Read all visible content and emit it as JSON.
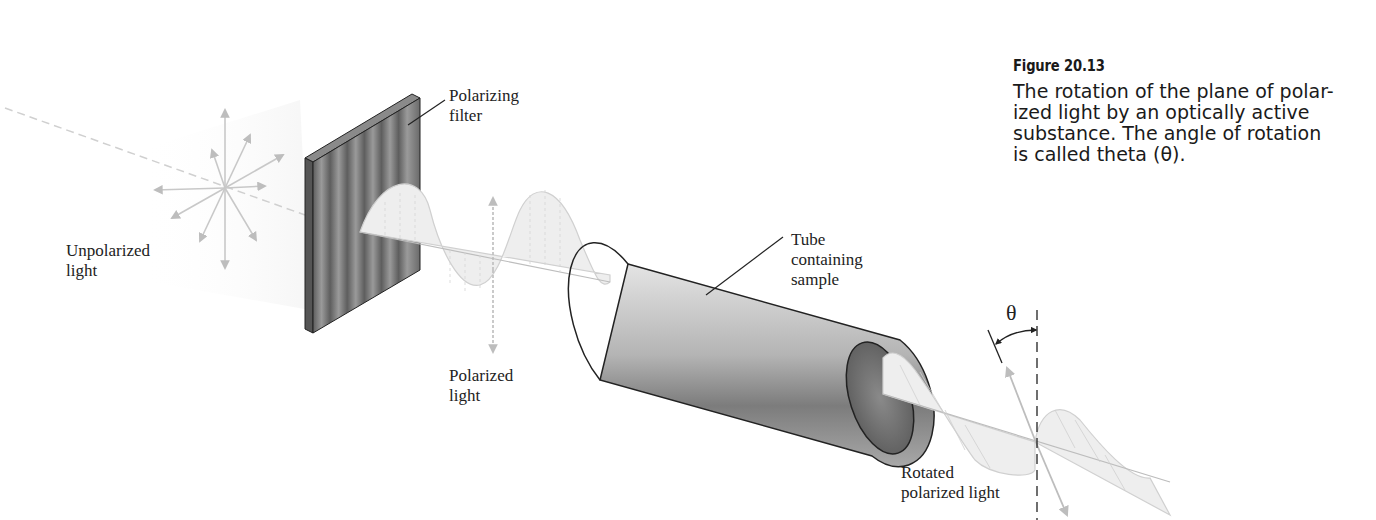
{
  "caption": {
    "figure_number": "Figure 20.13",
    "text": "The rotation of the plane of polar-\nized light by an optically active\nsubstance. The angle of rotation\nis called theta (θ)."
  },
  "labels": {
    "unpolarized_light": "Unpolarized\nlight",
    "polarizing_filter": "Polarizing\nfilter",
    "polarized_light": "Polarized\nlight",
    "tube": "Tube\ncontaining\nsample",
    "rotated_polarized_light": "Rotated\npolarized light",
    "theta_symbol": "θ"
  },
  "colors": {
    "filter": "#6e6e6e",
    "tube": "#9a9a9a",
    "wave": "#d8d8d8",
    "arrow": "#bdbdbd",
    "line": "#222222"
  }
}
